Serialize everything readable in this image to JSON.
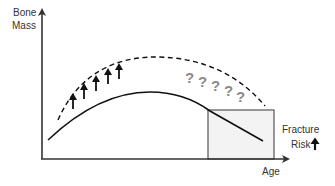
{
  "diagram": {
    "y_axis_label_line1": "Bone",
    "y_axis_label_line2": "Mass",
    "x_axis_label": "Age",
    "risk_label_line1": "Fracture",
    "risk_label_line2": "Risk",
    "risk_indicator_icon": "up-arrow-icon",
    "peak_increase_icon": "up-arrow-icon",
    "peak_increase_count": 5,
    "uncertainty_symbol": "?",
    "uncertainty_count": 5,
    "curves": [
      {
        "name": "potential-bone-mass",
        "style": "dashed"
      },
      {
        "name": "actual-bone-mass",
        "style": "solid"
      }
    ],
    "colors": {
      "axis": "#333333",
      "curve": "#111111",
      "question_marks": "#8a8a8a",
      "risk_box_fill": "#f3f3f3",
      "risk_box_border": "#555555"
    }
  }
}
